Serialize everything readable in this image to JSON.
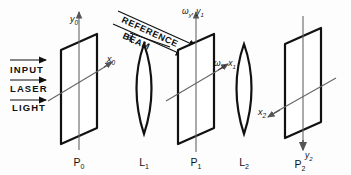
{
  "figure": {
    "type": "optical-system-diagram",
    "stroke_color": "#111111",
    "axis_color": "#555555",
    "background": "#fdfdfd"
  },
  "beams": {
    "input_label_lines": [
      "INPUT",
      "LASER",
      "LIGHT"
    ],
    "input_arrow_count": 3,
    "reference_label_lines": [
      "REFERENCE",
      "BEAM"
    ],
    "reference_arrow_count": 2,
    "angle_symbol": "θ"
  },
  "elements": [
    {
      "id": "P0",
      "kind": "plane",
      "label": "P",
      "sub": "0"
    },
    {
      "id": "L1",
      "kind": "lens",
      "label": "L",
      "sub": "1"
    },
    {
      "id": "P1",
      "kind": "plane",
      "label": "P",
      "sub": "1"
    },
    {
      "id": "L2",
      "kind": "lens",
      "label": "L",
      "sub": "2"
    },
    {
      "id": "P2",
      "kind": "plane",
      "label": "P",
      "sub": "2"
    }
  ],
  "axes": {
    "p0_vertical": {
      "base": "y",
      "sub": "0"
    },
    "p0_horizontal": {
      "base": "x",
      "sub": "0"
    },
    "p1_vertical": {
      "base": "ω",
      "sub": "y",
      "tail": ", y",
      "tail_sub": "1"
    },
    "p1_horizontal": {
      "base": "ω",
      "sub": "x",
      "tail": ", x",
      "tail_sub": "1"
    },
    "p2_horizontal": {
      "base": "x",
      "sub": "2"
    },
    "p2_vertical": {
      "base": "y",
      "sub": "2"
    }
  }
}
